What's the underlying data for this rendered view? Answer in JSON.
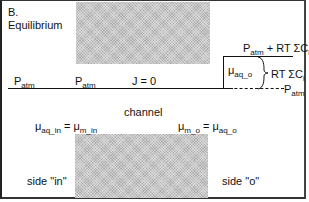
{
  "panel": {
    "label": "B.",
    "title": "Equilibrium"
  },
  "top_row": {
    "p_left": {
      "base": "P",
      "sub": "atm"
    },
    "p_mid": {
      "base": "P",
      "sub": "atm"
    },
    "flux": "J = 0"
  },
  "pressure_step": {
    "upper_label": {
      "base": "P",
      "sub": "atm",
      "suffix": " + RT ΣC",
      "suffix_sub": "i"
    },
    "brace_label": {
      "text": "RT ΣC",
      "sub": "i"
    },
    "lower_label": {
      "base": "P",
      "sub": "atm"
    },
    "mu_label": {
      "base": "μ",
      "sub": "aq_o"
    }
  },
  "channel": {
    "label": "channel",
    "eq_in": {
      "lhs": "μ",
      "lhs_sub": "aq_in",
      "op": " = ",
      "rhs": "μ",
      "rhs_sub": "m_in"
    },
    "eq_out": {
      "lhs": "μ",
      "lhs_sub": "m_o",
      "op": " = ",
      "rhs": "μ",
      "rhs_sub": "aq_o"
    }
  },
  "sides": {
    "in": "side \"in\"",
    "out": "side \"o\""
  },
  "colors": {
    "shade": "#c8c8c8",
    "line": "#111111"
  }
}
